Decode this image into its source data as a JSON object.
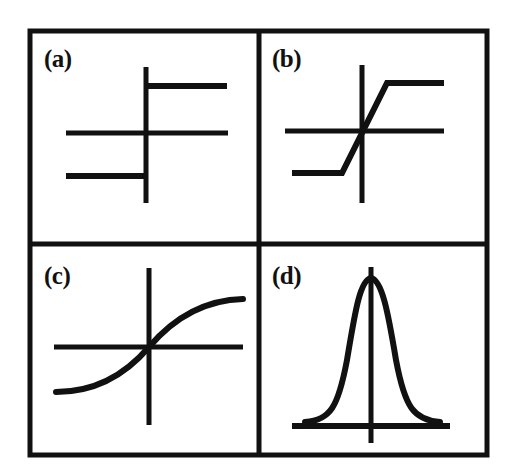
{
  "figure": {
    "background_color": "#ffffff",
    "ink_color": "#111111",
    "border": {
      "x": 30,
      "y": 31,
      "width": 457,
      "height": 424,
      "stroke_width": 5
    },
    "dividers": {
      "vertical_x": 259,
      "horizontal_y": 244,
      "stroke_width": 5
    }
  },
  "panels": [
    {
      "id": "a",
      "label": "(a)",
      "name": "hard-limit-step-function",
      "description": "Hard-limiting threshold (step) function",
      "axes": {
        "y_axis": {
          "x": 146,
          "y1": 67,
          "y2": 203
        },
        "x_axis": {
          "y": 133,
          "x1": 66,
          "x2": 228
        }
      },
      "segments": [
        {
          "name": "upper-step",
          "x1": 146,
          "y1": 86,
          "x2": 227,
          "y2": 86
        },
        {
          "name": "lower-step",
          "x1": 66,
          "y1": 176,
          "x2": 146,
          "y2": 176
        }
      ],
      "stroke_width": 5
    },
    {
      "id": "b",
      "label": "(b)",
      "name": "piecewise-linear-saturating-function",
      "description": "Piecewise-linear (saturating ramp) function",
      "axes": {
        "y_axis": {
          "x": 362,
          "y1": 65,
          "y2": 203
        },
        "x_axis": {
          "y": 131,
          "x1": 285,
          "x2": 444
        }
      },
      "segments": [
        {
          "name": "upper-saturation",
          "x1": 387,
          "y1": 83,
          "x2": 444,
          "y2": 83
        },
        {
          "name": "linear-ramp",
          "x1": 342,
          "y1": 173,
          "x2": 387,
          "y2": 83
        },
        {
          "name": "lower-saturation",
          "x1": 292,
          "y1": 173,
          "x2": 342,
          "y2": 173
        }
      ],
      "stroke_width": 5
    },
    {
      "id": "c",
      "label": "(c)",
      "name": "sigmoid-function",
      "description": "Smooth sigmoid (tanh-like) function",
      "axes": {
        "y_axis": {
          "x": 149,
          "y1": 268,
          "y2": 425
        },
        "x_axis": {
          "y": 347,
          "x1": 54,
          "x2": 243
        }
      },
      "curve": {
        "name": "sigmoid-curve",
        "path": "M 56 392 C 96 392 126 374 149 347 C 172 320 203 300 243 299",
        "x_start": 56,
        "y_start": 392,
        "x_end": 243,
        "y_end": 299,
        "inflection_x": 149,
        "inflection_y": 347
      },
      "stroke_width": 5
    },
    {
      "id": "d",
      "label": "(d)",
      "name": "gaussian-radial-basis-function",
      "description": "Gaussian (bell-shaped radial basis) function",
      "axes": {
        "y_axis": {
          "x": 371,
          "y1": 267,
          "y2": 443
        },
        "x_axis": {
          "y": 426,
          "x1": 292,
          "x2": 450
        }
      },
      "curve": {
        "name": "gaussian-curve",
        "path": "M 305 422 C 330 420 338 408 347 360 C 355 312 360 280 371 278 C 382 280 388 312 396 360 C 405 408 414 420 440 422",
        "peak_x": 371,
        "peak_y": 278,
        "left_tail_x": 305,
        "right_tail_x": 440,
        "baseline_y": 422
      },
      "stroke_width": 5
    }
  ]
}
